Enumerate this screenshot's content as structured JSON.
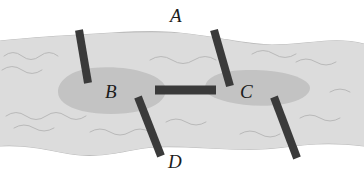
{
  "figure": {
    "width": 364,
    "height": 182,
    "background_color": "#ffffff"
  },
  "labels": {
    "a": "A",
    "b": "B",
    "c": "C",
    "d": "D"
  },
  "colors": {
    "background": "#ffffff",
    "river_fill": "#dcdcdc",
    "river_outline": "#b4b4b4",
    "shoal_fill": "#c2c2c2",
    "wave_line": "#b8b8b8",
    "bar_fill": "#3a3a3a",
    "label_text": "#1c1c1c"
  },
  "features": {
    "river": {
      "name": "river-band",
      "description": "Horizontal light gray river band with wavy banks"
    },
    "shoals": [
      {
        "name": "shoal-left",
        "label": "B",
        "cx": 112,
        "cy": 90,
        "rx": 56,
        "ry": 23
      },
      {
        "name": "shoal-right",
        "label": "C",
        "cx": 257,
        "cy": 89,
        "rx": 53,
        "ry": 18
      }
    ],
    "bars": [
      {
        "name": "bar-a-left",
        "label": "A",
        "x1": 79,
        "y1": 30,
        "x2": 88,
        "y2": 83,
        "width": 8
      },
      {
        "name": "bar-a-right",
        "label": "A",
        "x1": 214,
        "y1": 30,
        "x2": 230,
        "y2": 86,
        "width": 8
      },
      {
        "name": "bar-center",
        "label": "",
        "x1": 155,
        "y1": 90,
        "x2": 216,
        "y2": 90,
        "width": 9
      },
      {
        "name": "bar-d-left",
        "label": "D",
        "x1": 138,
        "y1": 97,
        "x2": 161,
        "y2": 156,
        "width": 8
      },
      {
        "name": "bar-d-right",
        "label": "",
        "x1": 274,
        "y1": 97,
        "x2": 297,
        "y2": 158,
        "width": 8
      }
    ]
  }
}
